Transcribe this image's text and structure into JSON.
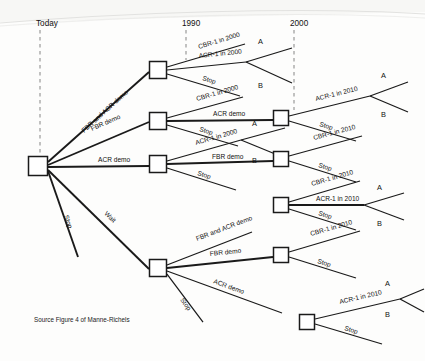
{
  "figure": {
    "source_note": "Source  Figure 4 of Manne-Richels"
  },
  "timeline": {
    "columns": [
      {
        "label": "Today",
        "x": 36
      },
      {
        "label": "1990",
        "x": 182
      },
      {
        "label": "2000",
        "x": 290
      }
    ]
  },
  "labels": {
    "fbr_and_acr_demo": "FBR and ACR demo",
    "fbr_demo": "FBR demo",
    "acr_demo": "ACR demo",
    "stop": "Stop",
    "wait": "Wait",
    "cbr1_2000": "CBR-1 in 2000",
    "acr1_2000": "ACR-1 in 2000",
    "cbr1_2010": "CBR-1 in 2010",
    "acr1_2010": "ACR-1 in 2010",
    "outcome_a": "A",
    "outcome_b": "B"
  },
  "nodes": [
    {
      "id": "root",
      "x": 38,
      "y": 166,
      "w": 19,
      "h": 19
    },
    {
      "id": "n1990a",
      "x": 158,
      "y": 70,
      "w": 17,
      "h": 17
    },
    {
      "id": "n1990b",
      "x": 158,
      "y": 121,
      "w": 17,
      "h": 17
    },
    {
      "id": "n1990c",
      "x": 158,
      "y": 164,
      "w": 17,
      "h": 17
    },
    {
      "id": "n1990d",
      "x": 158,
      "y": 268,
      "w": 17,
      "h": 17
    },
    {
      "id": "n2000a",
      "x": 281,
      "y": 118,
      "w": 15,
      "h": 15
    },
    {
      "id": "n2000b",
      "x": 281,
      "y": 159,
      "w": 15,
      "h": 15
    },
    {
      "id": "n2000c",
      "x": 281,
      "y": 205,
      "w": 15,
      "h": 15
    },
    {
      "id": "n2000d",
      "x": 281,
      "y": 255,
      "w": 15,
      "h": 15
    },
    {
      "id": "n2000e",
      "x": 307,
      "y": 322,
      "w": 15,
      "h": 15
    }
  ],
  "edges": [
    {
      "from": "root",
      "label_key": "fbr_and_acr_demo",
      "weight": "med",
      "x1": 48,
      "y1": 162,
      "x2": 149,
      "y2": 72,
      "lx": 84,
      "ly": 133,
      "rot": -42
    },
    {
      "from": "root",
      "label_key": "fbr_demo",
      "weight": "med",
      "x1": 48,
      "y1": 165,
      "x2": 149,
      "y2": 122,
      "lx": 92,
      "ly": 131,
      "rot": -24
    },
    {
      "from": "root",
      "label_key": "acr_demo",
      "weight": "med",
      "x1": 48,
      "y1": 167,
      "x2": 149,
      "y2": 166,
      "lx": 98,
      "ly": 162,
      "rot": 0
    },
    {
      "from": "root",
      "label_key": "stop",
      "weight": "med",
      "x1": 48,
      "y1": 171,
      "x2": 78,
      "y2": 257,
      "lx": 64,
      "ly": 216,
      "rot": 71
    },
    {
      "from": "root",
      "label_key": "wait",
      "weight": "med",
      "x1": 48,
      "y1": 170,
      "x2": 149,
      "y2": 269,
      "lx": 104,
      "ly": 214,
      "rot": 44
    },
    {
      "from": "n1990a",
      "label_key": "cbr1_2000",
      "weight": "thin",
      "x1": 167,
      "y1": 67,
      "x2": 245,
      "y2": 44,
      "lx": 199,
      "ly": 49,
      "rot": -17
    },
    {
      "from": "n1990a",
      "label_key": "acr1_2000",
      "weight": "thin",
      "x1": 167,
      "y1": 70,
      "x2": 246,
      "y2": 62,
      "lx": 199,
      "ly": 58,
      "rot": -6
    },
    {
      "from": "n1990a",
      "label_key": "stop",
      "weight": "thin",
      "x1": 167,
      "y1": 74,
      "x2": 240,
      "y2": 96,
      "lx": 202,
      "ly": 80,
      "rot": 17
    },
    {
      "from": "n1990b",
      "label_key": "cbr1_2000",
      "weight": "thin",
      "x1": 167,
      "y1": 118,
      "x2": 243,
      "y2": 97,
      "lx": 197,
      "ly": 101,
      "rot": -16
    },
    {
      "from": "n1990b",
      "label_key": "acr_demo",
      "weight": "med",
      "x1": 167,
      "y1": 121,
      "x2": 273,
      "y2": 120,
      "lx": 213,
      "ly": 116,
      "rot": 0
    },
    {
      "from": "n1990b",
      "label_key": "stop",
      "weight": "thin",
      "x1": 167,
      "y1": 125,
      "x2": 238,
      "y2": 146,
      "lx": 199,
      "ly": 131,
      "rot": 17
    },
    {
      "from": "n1990c",
      "label_key": "acr1_2000",
      "weight": "thin",
      "x1": 167,
      "y1": 161,
      "x2": 241,
      "y2": 140,
      "lx": 196,
      "ly": 145,
      "rot": -16
    },
    {
      "from": "n1990c",
      "label_key": "fbr_demo",
      "weight": "med",
      "x1": 167,
      "y1": 164,
      "x2": 273,
      "y2": 161,
      "lx": 212,
      "ly": 159,
      "rot": 0
    },
    {
      "from": "n1990c",
      "label_key": "stop",
      "weight": "thin",
      "x1": 167,
      "y1": 168,
      "x2": 236,
      "y2": 190,
      "lx": 197,
      "ly": 175,
      "rot": 17
    },
    {
      "from": "n1990d",
      "label_key": "fbr_and_acr_demo",
      "weight": "thin",
      "x1": 167,
      "y1": 265,
      "x2": 252,
      "y2": 232,
      "lx": 197,
      "ly": 241,
      "rot": -21
    },
    {
      "from": "n1990d",
      "label_key": "fbr_demo",
      "weight": "med",
      "x1": 167,
      "y1": 268,
      "x2": 273,
      "y2": 257,
      "lx": 210,
      "ly": 256,
      "rot": -6
    },
    {
      "from": "n1990d",
      "label_key": "acr_demo",
      "weight": "thin",
      "x1": 167,
      "y1": 271,
      "x2": 282,
      "y2": 313,
      "lx": 213,
      "ly": 283,
      "rot": 20
    },
    {
      "from": "n1990d",
      "label_key": "stop",
      "weight": "thin",
      "x1": 167,
      "y1": 274,
      "x2": 203,
      "y2": 322,
      "lx": 180,
      "ly": 300,
      "rot": 54
    },
    {
      "from": "n2000a",
      "label_key": "acr1_2010",
      "weight": "thin",
      "x1": 289,
      "y1": 116,
      "x2": 370,
      "y2": 96,
      "lx": 316,
      "ly": 101,
      "rot": -14
    },
    {
      "from": "n2000a",
      "label_key": "stop",
      "weight": "thin",
      "x1": 289,
      "y1": 121,
      "x2": 356,
      "y2": 141,
      "lx": 319,
      "ly": 126,
      "rot": 17
    },
    {
      "from": "n2000b",
      "label_key": "cbr1_2010",
      "weight": "thin",
      "x1": 289,
      "y1": 156,
      "x2": 362,
      "y2": 136,
      "lx": 314,
      "ly": 140,
      "rot": -15
    },
    {
      "from": "n2000b",
      "label_key": "stop",
      "weight": "thin",
      "x1": 289,
      "y1": 161,
      "x2": 356,
      "y2": 182,
      "lx": 318,
      "ly": 167,
      "rot": 17
    },
    {
      "from": "n2000c",
      "label_key": "cbr1_2010",
      "weight": "thin",
      "x1": 289,
      "y1": 202,
      "x2": 360,
      "y2": 181,
      "lx": 312,
      "ly": 186,
      "rot": -16
    },
    {
      "from": "n2000c",
      "label_key": "acr1_2010",
      "weight": "med",
      "x1": 289,
      "y1": 205,
      "x2": 364,
      "y2": 205,
      "lx": 316,
      "ly": 201,
      "rot": 0
    },
    {
      "from": "n2000c",
      "label_key": "stop",
      "weight": "thin",
      "x1": 289,
      "y1": 209,
      "x2": 356,
      "y2": 230,
      "lx": 318,
      "ly": 215,
      "rot": 17
    },
    {
      "from": "n2000d",
      "label_key": "cbr1_2010",
      "weight": "thin",
      "x1": 289,
      "y1": 252,
      "x2": 360,
      "y2": 231,
      "lx": 311,
      "ly": 236,
      "rot": -16
    },
    {
      "from": "n2000d",
      "label_key": "stop",
      "weight": "thin",
      "x1": 289,
      "y1": 257,
      "x2": 356,
      "y2": 278,
      "lx": 317,
      "ly": 263,
      "rot": 17
    },
    {
      "from": "n2000e",
      "label_key": "acr1_2010",
      "weight": "thin",
      "x1": 315,
      "y1": 319,
      "x2": 400,
      "y2": 299,
      "lx": 340,
      "ly": 304,
      "rot": -13
    },
    {
      "from": "n2000e",
      "label_key": "stop",
      "weight": "thin",
      "x1": 315,
      "y1": 324,
      "x2": 382,
      "y2": 344,
      "lx": 344,
      "ly": 330,
      "rot": 17
    }
  ],
  "forks": [
    {
      "id": "fork-top",
      "apex_x": 246,
      "apex_y": 62,
      "a_x2": 292,
      "a_y2": 48,
      "b_x2": 292,
      "b_y2": 83,
      "a_lx": 258,
      "a_ly": 44,
      "b_lx": 258,
      "b_ly": 88
    },
    {
      "id": "fork-mid-upper",
      "apex_x": 241,
      "apex_y": 140,
      "a_x2": 285,
      "a_y2": 128,
      "b_x2": 285,
      "b_y2": 158,
      "a_lx": 252,
      "a_ly": 126,
      "b_lx": 252,
      "b_ly": 163
    },
    {
      "id": "fork-2000a",
      "apex_x": 370,
      "apex_y": 96,
      "a_x2": 408,
      "a_y2": 82,
      "b_x2": 408,
      "b_y2": 112,
      "a_lx": 381,
      "a_ly": 78,
      "b_lx": 381,
      "b_ly": 117
    },
    {
      "id": "fork-2000c",
      "apex_x": 364,
      "apex_y": 205,
      "a_x2": 404,
      "a_y2": 193,
      "b_x2": 404,
      "b_y2": 220,
      "a_lx": 377,
      "a_ly": 190,
      "b_lx": 377,
      "b_ly": 226
    },
    {
      "id": "fork-2000e",
      "apex_x": 400,
      "apex_y": 299,
      "a_x2": 424,
      "a_y2": 289,
      "b_x2": 424,
      "b_y2": 312,
      "a_lx": 385,
      "a_ly": 286,
      "b_lx": 385,
      "b_ly": 317
    }
  ]
}
